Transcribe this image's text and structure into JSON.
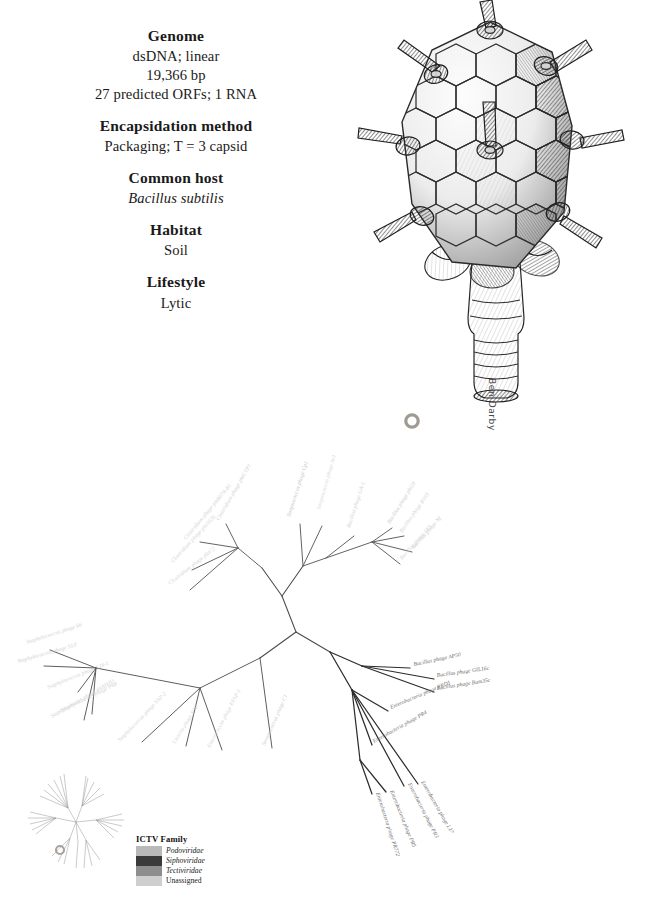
{
  "factsheet": {
    "groups": [
      {
        "heading": "Genome",
        "lines": [
          {
            "text": "dsDNA; linear",
            "italic": false
          },
          {
            "text": "19,366 bp",
            "italic": false
          },
          {
            "text": "27 predicted ORFs; 1 RNA",
            "italic": false
          }
        ]
      },
      {
        "heading": "Encapsidation method",
        "lines": [
          {
            "text": "Packaging; T = 3 capsid",
            "italic": false
          }
        ]
      },
      {
        "heading": "Common host",
        "lines": [
          {
            "text": "Bacillus subtilis",
            "italic": true
          }
        ]
      },
      {
        "heading": "Habitat",
        "lines": [
          {
            "text": "Soil",
            "italic": false
          }
        ]
      },
      {
        "heading": "Lifestyle",
        "lines": [
          {
            "text": "Lytic",
            "italic": false
          }
        ]
      }
    ]
  },
  "illustration": {
    "subject": "tectivirus-capsid-drawing",
    "signature": "Ben Darby"
  },
  "legend": {
    "title": "ICTV Family",
    "items": [
      {
        "label": "Podoviridae",
        "color": "#b9b9b9",
        "italic": true
      },
      {
        "label": "Siphoviridae",
        "color": "#3a3a3a",
        "italic": true
      },
      {
        "label": "Tectiviridae",
        "color": "#8e8e8e",
        "italic": true
      },
      {
        "label": "Unassigned",
        "color": "#cfcfcf",
        "italic": false
      }
    ]
  },
  "tree": {
    "type": "unrooted-radial-phylogeny",
    "highlight_marker": {
      "x": 412,
      "y": 21,
      "label": "highlighted-taxon-marker"
    },
    "root": {
      "x": 296,
      "y": 232
    },
    "tips": [
      {
        "name": "Clostridium phage phi8074-B1",
        "x": 186,
        "y": 140,
        "angle": -50,
        "color": "#d2d2d2",
        "anchor": "start"
      },
      {
        "name": "Clostridium phage phiCTP1",
        "x": 219,
        "y": 121,
        "angle": -60,
        "color": "#cfcfcf",
        "anchor": "start"
      },
      {
        "name": "Clostridium phage phi3626",
        "x": 173,
        "y": 163,
        "angle": -47,
        "color": "#d4d4d4",
        "anchor": "start"
      },
      {
        "name": "Clostridium phage phiC2",
        "x": 170,
        "y": 185,
        "angle": -38,
        "color": "#d4d4d4",
        "anchor": "start"
      },
      {
        "name": "Streptococcus phage Cp1",
        "x": 290,
        "y": 117,
        "angle": -72,
        "color": "#c2c2c2",
        "anchor": "start"
      },
      {
        "name": "Streptococcus phage Av1",
        "x": 320,
        "y": 110,
        "angle": -74,
        "color": "#dadada",
        "anchor": "start"
      },
      {
        "name": "Bacillus phage GA-1",
        "x": 350,
        "y": 128,
        "angle": -72,
        "color": "#d0d0d0",
        "anchor": "start"
      },
      {
        "name": "Bacillus phage phi29",
        "x": 390,
        "y": 124,
        "angle": -58,
        "color": "#cacaca",
        "anchor": "start"
      },
      {
        "name": "Bacillus phage B103",
        "x": 402,
        "y": 133,
        "angle": -55,
        "color": "#d2d2d2",
        "anchor": "start"
      },
      {
        "name": "Bacillus phage Nf",
        "x": 414,
        "y": 149,
        "angle": -48,
        "color": "#cecece",
        "anchor": "start"
      },
      {
        "name": "Bacillus phage SF5",
        "x": 402,
        "y": 160,
        "angle": -48,
        "color": "#d6d6d6",
        "anchor": "start"
      },
      {
        "name": "Staphylococcus phage 66",
        "x": 27,
        "y": 244,
        "angle": -18,
        "color": "#d0d0d0",
        "anchor": "start"
      },
      {
        "name": "Staphylococcus phage S13'",
        "x": 18,
        "y": 263,
        "angle": -16,
        "color": "#cdcdcd",
        "anchor": "start"
      },
      {
        "name": "Staphylococcus phage S24-1",
        "x": 48,
        "y": 289,
        "angle": -22,
        "color": "#d2d2d2",
        "anchor": "start"
      },
      {
        "name": "Staphylococcus phage P68",
        "x": 62,
        "y": 312,
        "angle": -26,
        "color": "#d0d0d0",
        "anchor": "start"
      },
      {
        "name": "Staphylococcus phage 44AHJD",
        "x": 52,
        "y": 318,
        "angle": -30,
        "color": "#d4d4d4",
        "anchor": "start"
      },
      {
        "name": "Staphylococcus phage SAP-2",
        "x": 120,
        "y": 342,
        "angle": -46,
        "color": "#d4d4d4",
        "anchor": "start"
      },
      {
        "name": "Listeria phage P70",
        "x": 175,
        "y": 344,
        "angle": -58,
        "color": "#d6d6d6",
        "anchor": "start"
      },
      {
        "name": "Enterococcus phage EFAP-1",
        "x": 210,
        "y": 348,
        "angle": -62,
        "color": "#d4d4d4",
        "anchor": "start"
      },
      {
        "name": "Streptococcus phage C1",
        "x": 265,
        "y": 346,
        "angle": -66,
        "color": "#cfcfcf",
        "anchor": "start"
      },
      {
        "name": "Bacillus phage AP50",
        "x": 414,
        "y": 266,
        "angle": -12,
        "color": "#6a6a6a",
        "anchor": "start"
      },
      {
        "name": "Bacillus phage GIL16c",
        "x": 437,
        "y": 277,
        "angle": -8,
        "color": "#6a6a6a",
        "anchor": "start"
      },
      {
        "name": "Bacillus phage Bam35c",
        "x": 437,
        "y": 290,
        "angle": -9,
        "color": "#6a6a6a",
        "anchor": "start"
      },
      {
        "name": "Enterobacteria phage PRD1",
        "x": 391,
        "y": 309,
        "angle": -23,
        "color": "#6e6e6e",
        "anchor": "start"
      },
      {
        "name": "Enterobacteria phage PR4",
        "x": 374,
        "y": 343,
        "angle": -29,
        "color": "#6e6e6e",
        "anchor": "start"
      },
      {
        "name": "Enterobacteria phage L17",
        "x": 421,
        "y": 382,
        "angle": 60,
        "color": "#6a6a6a",
        "anchor": "start"
      },
      {
        "name": "Enterobacteria phage PR3",
        "x": 408,
        "y": 384,
        "angle": 63,
        "color": "#6e6e6e",
        "anchor": "start"
      },
      {
        "name": "Enterobacteria phage PR772",
        "x": 376,
        "y": 393,
        "angle": 72,
        "color": "#6e6e6e",
        "anchor": "start"
      },
      {
        "name": "Enterobacteria phage PR5",
        "x": 390,
        "y": 391,
        "angle": 68,
        "color": "#6a6a6a",
        "anchor": "start"
      }
    ]
  },
  "inset": {
    "label": "whole-tree-overview"
  }
}
